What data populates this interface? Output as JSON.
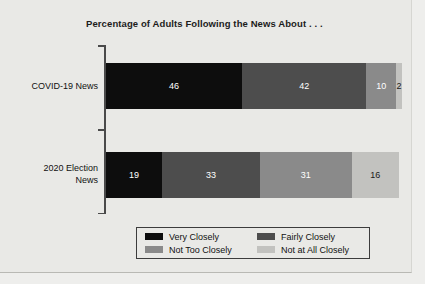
{
  "chart_data": {
    "type": "bar",
    "orientation": "horizontal",
    "stacked": true,
    "stack_mode": "percent",
    "title": "Percentage of Adults Following the News About . . .",
    "xlabel": "",
    "ylabel": "",
    "xlim": [
      0,
      100
    ],
    "grid": false,
    "legend_position": "bottom",
    "categories": [
      "COVID-19 News",
      "2020 Election News"
    ],
    "category_label_lines": [
      [
        "COVID-19 News"
      ],
      [
        "2020 Election",
        "News"
      ]
    ],
    "series": [
      {
        "name": "Very Closely",
        "color": "#0d0d0d",
        "values": [
          46,
          19
        ],
        "label_color": "#ffffff"
      },
      {
        "name": "Fairly Closely",
        "color": "#4d4d4d",
        "values": [
          42,
          33
        ],
        "label_color": "#ffffff"
      },
      {
        "name": "Not Too Closely",
        "color": "#8a8a8a",
        "values": [
          10,
          31
        ],
        "label_color": "#ffffff"
      },
      {
        "name": "Not at All Closely",
        "color": "#c2c2bf",
        "values": [
          2,
          16
        ],
        "label_color": "#1a1a1a"
      }
    ],
    "value_labels": {
      "COVID-19 News": [
        "46",
        "42",
        "10",
        "2"
      ],
      "2020 Election News": [
        "19",
        "33",
        "31",
        "16"
      ]
    },
    "legend_entries": [
      "Very Closely",
      "Fairly Closely",
      "Not Too Closely",
      "Not at All Closely"
    ],
    "legend_order_grid": [
      [
        "Very Closely",
        "Fairly Closely"
      ],
      [
        "Not Too Closely",
        "Not at All Closely"
      ]
    ]
  },
  "colors": {
    "background": "#e9e9e6",
    "axis": "#4a4a4a",
    "text": "#111111",
    "legend_border": "#3c3c3c"
  }
}
